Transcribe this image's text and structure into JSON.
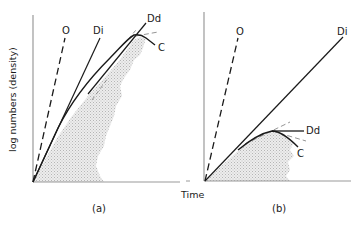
{
  "figure": {
    "y_axis_label": "log numbers (density)",
    "x_axis_label": "Time",
    "colors": {
      "line": "#1a1a1a",
      "dashed": "#7a7a7a",
      "shade": "#cfcfcf",
      "background": "#ffffff"
    },
    "panels": [
      {
        "id": "a",
        "label": "(a)",
        "lines": [
          {
            "name": "O",
            "label": "O",
            "style": "dashed",
            "description": "steep dashed line from origin"
          },
          {
            "name": "Di",
            "label": "Di",
            "style": "solid",
            "description": "straight line from origin"
          },
          {
            "name": "Dd",
            "label": "Dd",
            "style": "solid",
            "description": "line continuing curve upward"
          },
          {
            "name": "C",
            "label": "C",
            "style": "solid",
            "description": "curve peaking then declining"
          }
        ],
        "shaded_region": "stippled area under the density curve"
      },
      {
        "id": "b",
        "label": "(b)",
        "lines": [
          {
            "name": "O",
            "label": "O",
            "style": "dashed",
            "description": "steep dashed line from origin"
          },
          {
            "name": "Di",
            "label": "Di",
            "style": "solid",
            "description": "long straight line from origin"
          },
          {
            "name": "Dd",
            "label": "Dd",
            "style": "solid",
            "description": "levelling-off line"
          },
          {
            "name": "C",
            "label": "C",
            "style": "solid",
            "description": "curve peaking early then declining"
          }
        ],
        "shaded_region": "stippled area under the density curve"
      }
    ]
  }
}
